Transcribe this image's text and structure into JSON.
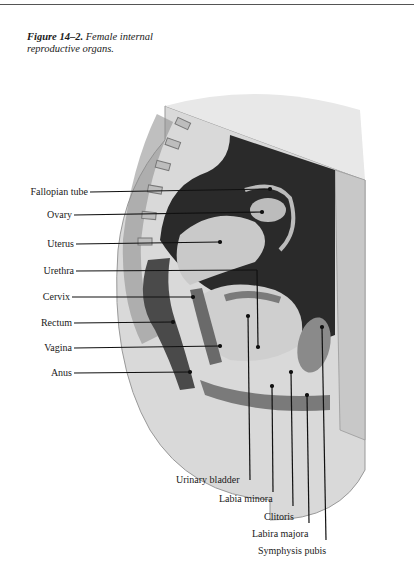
{
  "caption": {
    "figure_number": "Figure 14–2.",
    "title_line1": "Female internal",
    "title_line2": "reproductive organs."
  },
  "labels_left": [
    {
      "id": "fallopian-tube",
      "text": "Fallopian tube"
    },
    {
      "id": "ovary",
      "text": "Ovary"
    },
    {
      "id": "uterus",
      "text": "Uterus"
    },
    {
      "id": "urethra",
      "text": "Urethra"
    },
    {
      "id": "cervix",
      "text": "Cervix"
    },
    {
      "id": "rectum",
      "text": "Rectum"
    },
    {
      "id": "vagina",
      "text": "Vagina"
    },
    {
      "id": "anus",
      "text": "Anus"
    }
  ],
  "labels_bottom": [
    {
      "id": "urinary-bladder",
      "text": "Urinary bladder"
    },
    {
      "id": "labia-minora",
      "text": "Labia minora"
    },
    {
      "id": "clitoris",
      "text": "Clitoris"
    },
    {
      "id": "labira-majora",
      "text": "Labira majora"
    },
    {
      "id": "symphysis-pubis",
      "text": "Symphysis pubis"
    }
  ]
}
